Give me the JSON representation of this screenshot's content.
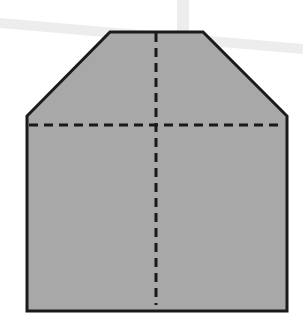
{
  "diagram": {
    "shape": {
      "name": "house-shaped polygon",
      "fill": "#a8a8a8",
      "stroke": "#1a1a1a",
      "points": [
        [
          110,
          32
        ],
        [
          203,
          32
        ],
        [
          287,
          116
        ],
        [
          287,
          311
        ],
        [
          27,
          311
        ],
        [
          27,
          116
        ]
      ]
    },
    "fold_lines": {
      "stroke": "#1a1a1a",
      "dash": "9 6",
      "vertical": {
        "x1": 156,
        "y1": 33,
        "x2": 156,
        "y2": 305
      },
      "horizontal": {
        "x1": 29,
        "y1": 125,
        "x2": 283,
        "y2": 125
      }
    },
    "background_marks": {
      "color": "#ededed",
      "vertical_band": {
        "x": 177,
        "y": 0,
        "width": 12,
        "height": 32
      },
      "diagonal_band": {
        "points": [
          [
            0,
            18
          ],
          [
            303,
            44
          ],
          [
            303,
            54
          ],
          [
            0,
            28
          ]
        ]
      }
    }
  }
}
